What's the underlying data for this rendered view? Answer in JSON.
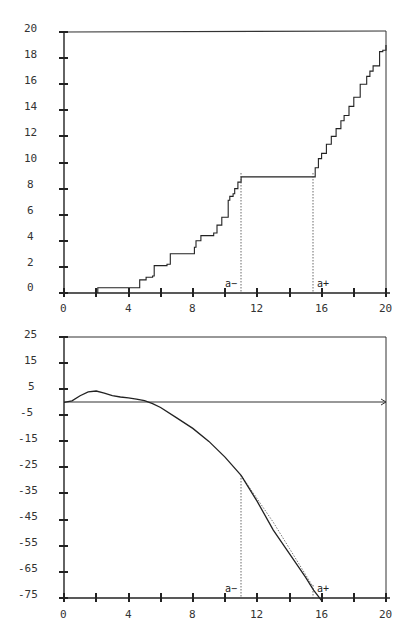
{
  "chart_data": [
    {
      "type": "line",
      "id": "top",
      "title": "",
      "xlabel": "",
      "ylabel": "",
      "xlim": [
        0,
        20
      ],
      "ylim": [
        0,
        20
      ],
      "x_tick_labels": [
        "0",
        "4",
        "8",
        "12",
        "16",
        "20"
      ],
      "x_tick_values": [
        0,
        2,
        4,
        6,
        8,
        10,
        12,
        14,
        16,
        18,
        20
      ],
      "y_tick_labels": [
        "0",
        "2",
        "4",
        "6",
        "8",
        "10",
        "12",
        "14",
        "16",
        "18",
        "20"
      ],
      "grid": false,
      "legend": null,
      "series": [
        {
          "name": "staircase",
          "style": "step",
          "x": [
            2.1,
            2.1,
            4.6,
            4.7,
            5.1,
            5.5,
            5.6,
            6.4,
            6.6,
            8.0,
            8.1,
            8.2,
            8.5,
            9.3,
            9.5,
            9.8,
            10.2,
            10.3,
            10.5,
            10.6,
            10.8,
            11.0,
            15.4,
            15.6,
            15.8,
            16.0,
            16.3,
            16.6,
            16.9,
            17.2,
            17.4,
            17.7,
            18.0,
            18.4,
            18.8,
            19.0,
            19.2,
            19.6,
            19.8,
            20.0
          ],
          "y": [
            0,
            0.4,
            0.4,
            1.0,
            1.2,
            1.3,
            2.1,
            2.2,
            3.0,
            3.0,
            3.5,
            4.0,
            4.4,
            4.6,
            5.2,
            5.8,
            7.1,
            7.4,
            7.6,
            8.0,
            8.5,
            8.9,
            8.9,
            9.6,
            10.3,
            10.7,
            11.4,
            12.0,
            12.6,
            13.2,
            13.6,
            14.3,
            15.0,
            16.0,
            16.6,
            17.0,
            17.4,
            18.5,
            18.6,
            19.0
          ]
        }
      ],
      "annotations": [
        {
          "text": "a−",
          "x": 11.0,
          "type": "vline-dotted"
        },
        {
          "text": "a+",
          "x": 15.4,
          "type": "vline-dotted"
        }
      ]
    },
    {
      "type": "line",
      "id": "bottom",
      "title": "",
      "xlabel": "",
      "ylabel": "",
      "xlim": [
        0,
        20
      ],
      "ylim": [
        -75,
        25
      ],
      "x_tick_labels": [
        "0",
        "4",
        "8",
        "12",
        "16",
        "20"
      ],
      "x_tick_values": [
        0,
        2,
        4,
        6,
        8,
        10,
        12,
        14,
        16,
        18,
        20
      ],
      "y_tick_labels": [
        "25",
        "15",
        "5",
        "-5",
        "-15",
        "-25",
        "-35",
        "-45",
        "-55",
        "-65",
        "-75"
      ],
      "grid": false,
      "legend": null,
      "reference_line": {
        "y": 0,
        "arrow": true
      },
      "series": [
        {
          "name": "curve",
          "style": "solid",
          "x": [
            0,
            0.5,
            1.0,
            1.5,
            2.0,
            2.5,
            3.0,
            3.5,
            4.0,
            4.5,
            5.0,
            5.5,
            6.0,
            7.0,
            8.0,
            9.0,
            10.0,
            11.0,
            12.0,
            13.0,
            14.0,
            15.0,
            15.5,
            16.0
          ],
          "y": [
            0,
            0.5,
            2.5,
            4.0,
            4.3,
            3.5,
            2.5,
            2.0,
            1.7,
            1.2,
            0.6,
            -0.5,
            -2,
            -6,
            -10,
            -15,
            -21,
            -28,
            -38,
            -49,
            -58,
            -67,
            -72,
            -76
          ]
        },
        {
          "name": "approximation",
          "style": "dotted",
          "x": [
            11.0,
            12.0,
            13.0,
            14.0,
            15.0,
            15.4
          ],
          "y": [
            -28,
            -37,
            -46,
            -56,
            -66,
            -70
          ]
        }
      ],
      "annotations": [
        {
          "text": "a−",
          "x": 11.0,
          "type": "vline-dotted"
        },
        {
          "text": "a+",
          "x": 15.4,
          "type": "vline-dotted"
        }
      ]
    }
  ],
  "top": {
    "y_labels": [
      "20",
      "18",
      "16",
      "14",
      "12",
      "10",
      "8",
      "6",
      "4",
      "2",
      "0"
    ],
    "x_labels": [
      "0",
      "4",
      "8",
      "12",
      "16",
      "20"
    ],
    "a_minus": "a−",
    "a_plus": "a+"
  },
  "bottom": {
    "y_labels": [
      "25",
      "15",
      "5",
      "-5",
      "-15",
      "-25",
      "-35",
      "-45",
      "-55",
      "-65",
      "-75"
    ],
    "x_labels": [
      "0",
      "4",
      "8",
      "12",
      "16",
      "20"
    ],
    "a_minus": "a−",
    "a_plus": "a+"
  }
}
